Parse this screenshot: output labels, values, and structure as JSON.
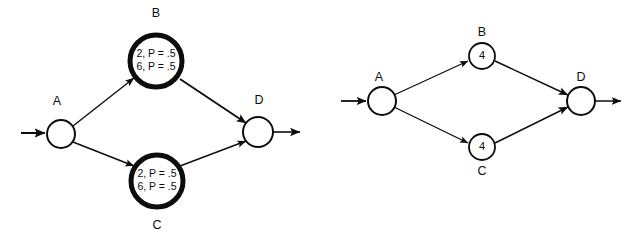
{
  "figure": {
    "background_color": "#ffffff",
    "stroke_color": "#0d0d0d",
    "panels": [
      {
        "id": "left-panel",
        "name": "probabilistic-network",
        "nodes": [
          {
            "id": "A",
            "label": "A",
            "label_position": "above",
            "inner_lines": [],
            "emphasis": "normal",
            "cx": 61,
            "cy": 134,
            "r": 14,
            "stroke_width": 2,
            "label_x": 57,
            "label_y": 102
          },
          {
            "id": "B",
            "label": "B",
            "label_position": "above",
            "inner_lines": [
              "2, P = .5",
              "6, P = .5"
            ],
            "emphasis": "bold",
            "cx": 156,
            "cy": 61,
            "r": 26,
            "stroke_width": 5,
            "label_x": 156,
            "label_y": 14
          },
          {
            "id": "C",
            "label": "C",
            "label_position": "below",
            "inner_lines": [
              "2, P = .5",
              "6, P = .5"
            ],
            "emphasis": "bold",
            "cx": 157,
            "cy": 181,
            "r": 26,
            "stroke_width": 5,
            "label_x": 157,
            "label_y": 226
          },
          {
            "id": "D",
            "label": "D",
            "label_position": "above",
            "inner_lines": [],
            "emphasis": "normal",
            "cx": 258,
            "cy": 132,
            "r": 15,
            "stroke_width": 2,
            "label_x": 259,
            "label_y": 101
          }
        ],
        "edges": [
          {
            "id": "start-to-A",
            "from": "start",
            "to": "A",
            "x1": 21,
            "y1": 133,
            "x2": 45,
            "y2": 133,
            "arrow": true,
            "stroke_width": 2
          },
          {
            "id": "A-to-B",
            "from": "A",
            "to": "B",
            "x1": 73,
            "y1": 126,
            "x2": 134,
            "y2": 78,
            "arrow": true,
            "stroke_width": 1.4
          },
          {
            "id": "A-to-C",
            "from": "A",
            "to": "C",
            "x1": 73,
            "y1": 142,
            "x2": 134,
            "y2": 166,
            "arrow": true,
            "stroke_width": 1.4
          },
          {
            "id": "B-to-D",
            "from": "B",
            "to": "D",
            "x1": 180,
            "y1": 79,
            "x2": 246,
            "y2": 123,
            "arrow": true,
            "stroke_width": 1.8
          },
          {
            "id": "C-to-D",
            "from": "C",
            "to": "D",
            "x1": 180,
            "y1": 166,
            "x2": 246,
            "y2": 141,
            "arrow": true,
            "stroke_width": 1.4
          },
          {
            "id": "D-to-end",
            "from": "D",
            "to": "end",
            "x1": 273,
            "y1": 132,
            "x2": 300,
            "y2": 132,
            "arrow": true,
            "stroke_width": 1.6
          }
        ]
      },
      {
        "id": "right-panel",
        "name": "deterministic-network",
        "nodes": [
          {
            "id": "A",
            "label": "A",
            "label_position": "above",
            "inner_lines": [],
            "emphasis": "normal",
            "cx": 382,
            "cy": 101,
            "r": 14,
            "stroke_width": 2,
            "label_x": 379,
            "label_y": 78
          },
          {
            "id": "B",
            "label": "B",
            "label_position": "above",
            "inner_lines": [
              "4"
            ],
            "emphasis": "normal",
            "cx": 482,
            "cy": 56,
            "r": 13,
            "stroke_width": 1.8,
            "label_x": 482,
            "label_y": 33
          },
          {
            "id": "C",
            "label": "C",
            "label_position": "below",
            "inner_lines": [
              "4"
            ],
            "emphasis": "normal",
            "cx": 482,
            "cy": 147,
            "r": 13,
            "stroke_width": 1.8,
            "label_x": 482,
            "label_y": 172
          },
          {
            "id": "D",
            "label": "D",
            "label_position": "above",
            "inner_lines": [],
            "emphasis": "normal",
            "cx": 581,
            "cy": 101,
            "r": 14,
            "stroke_width": 2,
            "label_x": 581,
            "label_y": 78
          }
        ],
        "edges": [
          {
            "id": "start-to-A",
            "from": "start",
            "to": "A",
            "x1": 341,
            "y1": 101,
            "x2": 366,
            "y2": 101,
            "arrow": true,
            "stroke_width": 1.8
          },
          {
            "id": "A-to-B",
            "from": "A",
            "to": "B",
            "x1": 394,
            "y1": 95,
            "x2": 468,
            "y2": 61,
            "arrow": true,
            "stroke_width": 1.3
          },
          {
            "id": "A-to-C",
            "from": "A",
            "to": "C",
            "x1": 394,
            "y1": 107,
            "x2": 468,
            "y2": 143,
            "arrow": true,
            "stroke_width": 1.3
          },
          {
            "id": "B-to-D",
            "from": "B",
            "to": "D",
            "x1": 495,
            "y1": 61,
            "x2": 568,
            "y2": 95,
            "arrow": true,
            "stroke_width": 1.5
          },
          {
            "id": "C-to-D",
            "from": "C",
            "to": "D",
            "x1": 495,
            "y1": 143,
            "x2": 568,
            "y2": 107,
            "arrow": true,
            "stroke_width": 1.5
          },
          {
            "id": "D-to-end",
            "from": "D",
            "to": "end",
            "x1": 596,
            "y1": 101,
            "x2": 621,
            "y2": 101,
            "arrow": true,
            "stroke_width": 1.5
          }
        ]
      }
    ]
  }
}
